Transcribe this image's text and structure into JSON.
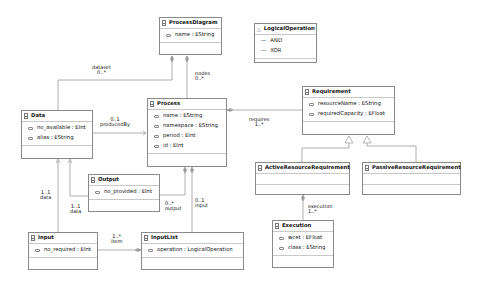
{
  "diagram": {
    "classes": {
      "processDiagram": {
        "name": "ProcessDiagram",
        "attributes": [
          {
            "label": "name : EString"
          }
        ]
      },
      "logicalOperation": {
        "name": "LogicalOperation",
        "icon": "enum-icon",
        "literals": [
          {
            "label": "AND"
          },
          {
            "label": "XOR"
          }
        ]
      },
      "data": {
        "name": "Data",
        "attributes": [
          {
            "label": "no_available : EInt"
          },
          {
            "label": "alias : EString"
          }
        ]
      },
      "process": {
        "name": "Process",
        "attributes": [
          {
            "label": "name : EString"
          },
          {
            "label": "namespace : EString"
          },
          {
            "label": "period : EInt"
          },
          {
            "label": "id : EInt"
          }
        ]
      },
      "requirement": {
        "name": "Requirement",
        "attributes": [
          {
            "label": "resourceName : EString"
          },
          {
            "label": "requiredCapacity : EFloat"
          }
        ]
      },
      "activeResourceRequirement": {
        "name": "ActiveResourceRequirement",
        "attributes": []
      },
      "passiveResourceRequirement": {
        "name": "PassiveResourceRequirement",
        "attributes": []
      },
      "output": {
        "name": "Output",
        "attributes": [
          {
            "label": "no_provided : EInt"
          }
        ]
      },
      "input": {
        "name": "Input",
        "attributes": [
          {
            "label": "no_required : EInt"
          }
        ]
      },
      "inputList": {
        "name": "InputList",
        "attributes": [
          {
            "label": "operation : LogicalOperation"
          }
        ]
      },
      "execution": {
        "name": "Execution",
        "attributes": [
          {
            "label": "wcet : EFloat"
          },
          {
            "label": "class : EString"
          }
        ]
      }
    },
    "labels": {
      "dataset": {
        "name": "dataset",
        "mult": "0..*"
      },
      "nodes": {
        "name": "nodes",
        "mult": "0..*"
      },
      "producedBy": {
        "mult": "0..1",
        "name": "producedBy"
      },
      "requires": {
        "name": "requires",
        "mult": "1..*"
      },
      "inputData": {
        "mult": "1..1",
        "name": "data"
      },
      "outputData": {
        "mult": "1..1",
        "name": "data"
      },
      "output": {
        "mult": "0..*",
        "name": "output"
      },
      "input": {
        "mult": "0..1",
        "name": "input"
      },
      "item": {
        "mult": "1..*",
        "name": "item"
      },
      "execution": {
        "name": "execution",
        "mult": "1..*"
      }
    },
    "colors": {
      "border": "#8a8a8a",
      "line": "#999999",
      "text": "#111111"
    }
  }
}
